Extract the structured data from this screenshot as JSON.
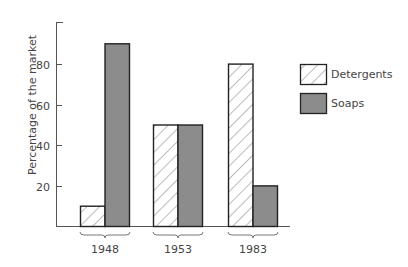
{
  "chart_data": {
    "type": "bar",
    "title": "",
    "xlabel": "",
    "ylabel": "Percentage of the market",
    "categories": [
      "1948",
      "1953",
      "1983"
    ],
    "series": [
      {
        "name": "Detergents",
        "values": [
          10,
          50,
          80
        ],
        "pattern": "hatched",
        "color": "#ffffff"
      },
      {
        "name": "Soaps",
        "values": [
          90,
          50,
          20
        ],
        "pattern": "solid",
        "color": "#8c8c8c"
      }
    ],
    "yticks": [
      20,
      40,
      60,
      80
    ],
    "ylim": [
      0,
      100
    ],
    "grid": false,
    "legend_position": "right"
  },
  "colors": {
    "axis": "#555555",
    "bar_outline": "#222222",
    "soaps_fill": "#8c8c8c",
    "hatch": "#777777"
  }
}
